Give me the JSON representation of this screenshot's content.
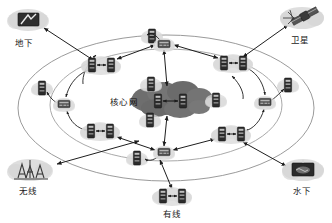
{
  "diagram": {
    "canvas": {
      "width": 332,
      "height": 223,
      "background": "#ffffff"
    },
    "core": {
      "label": "核心网",
      "label_x": 124,
      "label_y": 101,
      "cloud_cx": 170,
      "cloud_cy": 101,
      "cloud_fill": "#6e6e6e",
      "nodes": [
        {
          "x": 158,
          "y": 101
        },
        {
          "x": 183,
          "y": 101
        }
      ]
    },
    "ellipses": {
      "outer": {
        "cx": 166,
        "cy": 108,
        "rx": 148,
        "ry": 73,
        "stroke": "#8a8a8a"
      },
      "inner": {
        "cx": 166,
        "cy": 105,
        "rx": 116,
        "ry": 57,
        "stroke": "#8a8a8a"
      }
    },
    "colors": {
      "node_dark": "#2b2b2b",
      "node_mid": "#4a4a4a",
      "halo": "#d9d9d9",
      "arrow": "#1e1e1e",
      "ellipse": "#8a8a8a",
      "cloud_dark": "#6e6e6e",
      "cloud_light": "#cfcfcf",
      "text": "#1a1a1a"
    },
    "access_domains": [
      {
        "id": "underground",
        "label": "地下",
        "icon": "underground-icon",
        "label_x": 24,
        "label_y": 42,
        "icon_cx": 28,
        "icon_cy": 20
      },
      {
        "id": "satellite",
        "label": "卫星",
        "icon": "satellite-icon",
        "label_x": 300,
        "label_y": 40,
        "icon_cx": 302,
        "icon_cy": 18
      },
      {
        "id": "wireless",
        "label": "无线",
        "icon": "antenna-icon",
        "label_x": 28,
        "label_y": 192,
        "icon_cx": 30,
        "icon_cy": 170
      },
      {
        "id": "wired",
        "label": "有线",
        "icon": "server-pair-icon",
        "label_x": 172,
        "label_y": 215,
        "icon_cx": 172,
        "icon_cy": 196
      },
      {
        "id": "underwater",
        "label": "水下",
        "icon": "submarine-icon",
        "label_x": 302,
        "label_y": 192,
        "icon_cx": 303,
        "icon_cy": 170
      }
    ],
    "pair_nodes": [
      {
        "id": "pair-top-left",
        "cx": 101,
        "cy": 65
      },
      {
        "id": "pair-top-right",
        "cx": 233,
        "cy": 63
      },
      {
        "id": "pair-bottom-left",
        "cx": 100,
        "cy": 131
      },
      {
        "id": "pair-bottom-right",
        "cx": 231,
        "cy": 134
      }
    ],
    "hub_nodes": [
      {
        "id": "hub-top",
        "cx": 164,
        "cy": 44
      },
      {
        "id": "hub-bottom",
        "cx": 164,
        "cy": 152
      },
      {
        "id": "hub-left",
        "cx": 64,
        "cy": 104
      },
      {
        "id": "hub-right",
        "cx": 265,
        "cy": 102
      }
    ],
    "single_nodes": [
      {
        "id": "single-top-left",
        "cx": 152,
        "cy": 37
      },
      {
        "id": "single-mid-left",
        "cx": 151,
        "cy": 85
      },
      {
        "id": "single-mid-left-low",
        "cx": 150,
        "cy": 121
      },
      {
        "id": "single-bottom-left",
        "cx": 137,
        "cy": 158
      },
      {
        "id": "single-left-edge",
        "cx": 42,
        "cy": 88
      },
      {
        "id": "single-right-edge",
        "cx": 288,
        "cy": 85
      },
      {
        "id": "single-mid-right",
        "cx": 197,
        "cy": 104
      }
    ],
    "legend_note": "",
    "connections": [
      "地下 ↔ pair-top-left",
      "卫星 ↔ pair-top-right",
      "无线 ↔ hub-bottom-left-region",
      "有线 ↔ hub-bottom",
      "水下 ↔ pair-bottom-right",
      "hub-top ↔ 核心网",
      "hub-bottom ↔ 核心网"
    ]
  }
}
